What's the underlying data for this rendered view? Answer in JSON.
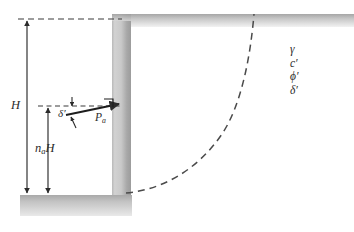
{
  "figure": {
    "background_color": "#ffffff"
  },
  "labels": {
    "wall_height": "H",
    "resultant_depth_symbol": "n",
    "resultant_depth_subscript": "a",
    "resultant_depth_suffix": "H",
    "wall_friction_angle": "δ",
    "wall_friction_angle_prime": "′",
    "active_force_symbol": "P",
    "active_force_subscript": "a"
  },
  "soil_properties": {
    "items": [
      {
        "name": "unit-weight",
        "symbol": "γ",
        "prime": ""
      },
      {
        "name": "effective-cohesion",
        "symbol": "c",
        "prime": "′"
      },
      {
        "name": "effective-friction-angle",
        "symbol": "ϕ",
        "prime": "′"
      },
      {
        "name": "wall-friction-angle",
        "symbol": "δ",
        "prime": "′"
      }
    ]
  },
  "geometry": {
    "canvas_width": 354,
    "canvas_height": 232,
    "wall": {
      "x": 112,
      "y": 14,
      "width": 18,
      "height": 191
    },
    "ground_left": {
      "x": 20,
      "y": 195,
      "width": 110,
      "height": 20
    },
    "ground_right": {
      "x": 130,
      "y": 14,
      "width": 224,
      "height": 13
    },
    "top_dashed_line": {
      "x1": 18,
      "y1": 19,
      "x2": 122,
      "y2": 19
    },
    "mid_dashed_line": {
      "x1": 38,
      "y1": 106,
      "x2": 120,
      "y2": 106
    },
    "dimension_H": {
      "x": 27,
      "y_top": 19,
      "y_bottom": 195
    },
    "dimension_naH": {
      "x": 48,
      "y_top": 106,
      "y_bottom": 195
    },
    "force_arrow": {
      "x1": 68,
      "y1": 114,
      "x2": 120,
      "y2": 104
    },
    "right_angle_marker": {
      "x": 112,
      "y": 98,
      "size": 8
    },
    "failure_surface": {
      "start_x": 126,
      "start_y": 193,
      "end_x": 255,
      "end_y": 14
    }
  },
  "colors": {
    "line": "#2b2b2b",
    "dashed": "#4a4a4a",
    "shade_light": "#e8e8e8",
    "shade_mid": "#c4c4c4",
    "shade_dark": "#9a9a9a",
    "text": "#2b2b2b"
  }
}
